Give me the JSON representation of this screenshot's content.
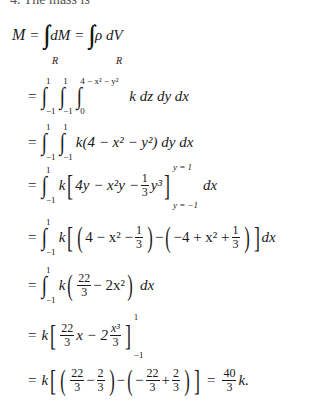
{
  "header_fragment": "4. The mass is",
  "lines": [
    {
      "id": "line-1",
      "text": "M = ∭_R dM = ∭_R ρ dV"
    },
    {
      "id": "line-2",
      "text": "= ∫_{-1}^{1} ∫_{-1}^{1} ∫_{0}^{4 - x^2 - y^2} k dz dy dx"
    },
    {
      "id": "line-3",
      "text": "= ∫_{-1}^{1} ∫_{-1}^{1} k(4 - x^2 - y^2) dy dx"
    },
    {
      "id": "line-4",
      "text": "= ∫_{-1}^{1} k[4y - x^2 y - (1/3) y^3]_{y=-1}^{y=1} dx"
    },
    {
      "id": "line-5",
      "text": "= ∫_{-1}^{1} k[(4 - x^2 - 1/3) - (-4 + x^2 + 1/3)] dx"
    },
    {
      "id": "line-6",
      "text": "= ∫_{-1}^{1} k(22/3 - 2x^2) dx"
    },
    {
      "id": "line-7",
      "text": "= k[(22/3) x - 2 (x^3/3)]_{-1}^{1}"
    },
    {
      "id": "line-8",
      "text": "= k[(22/3 - 2/3) - (-22/3 + 2/3)] = (40/3) k."
    }
  ],
  "tokens": {
    "M": "M",
    "eq": "=",
    "dM": "dM",
    "rho": "ρ",
    "dV": "dV",
    "R": "R",
    "one": "1",
    "neg_one": "−1",
    "zero": "0",
    "upper_z": "4 − x² − y²",
    "k": "k",
    "dz": "dz",
    "dy": "dy",
    "dx": "dx",
    "l3_body": "k(4 − x² − y²)",
    "l4_a": "4y − x²y −",
    "l4_y3": "y³",
    "y_eq_1": "y = 1",
    "y_eq_neg1": "y = −1",
    "l5_a": "4 − x² −",
    "l5_b": "−4 + x² +",
    "minus": "−",
    "n22": "22",
    "n3": "3",
    "n2": "2",
    "n40": "40",
    "l6_b": "− 2x²",
    "l7_x": "x − 2",
    "x3": "x³",
    "plus": "+",
    "k_end": "k."
  }
}
